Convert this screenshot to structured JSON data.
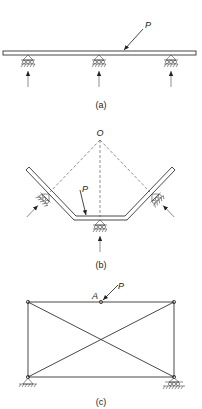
{
  "figures": [
    {
      "id": "a",
      "caption": "(a)",
      "description": "Beam on three roller supports with inclined load P",
      "load_label": "P",
      "supports": [
        "roller",
        "roller",
        "roller"
      ]
    },
    {
      "id": "b",
      "caption": "(b)",
      "description": "Bent bar on three roller supports with reaction lines meeting at point O",
      "point_label": "O",
      "load_label": "P",
      "supports": [
        "roller",
        "roller",
        "roller"
      ]
    },
    {
      "id": "c",
      "caption": "(c)",
      "description": "Rectangular truss with crossed diagonals, pin and roller supports, load P at joint A",
      "joint_label": "A",
      "load_label": "P",
      "supports": [
        "pin",
        "roller"
      ]
    }
  ],
  "colors": {
    "stroke": "#333333",
    "background": "#ffffff"
  }
}
